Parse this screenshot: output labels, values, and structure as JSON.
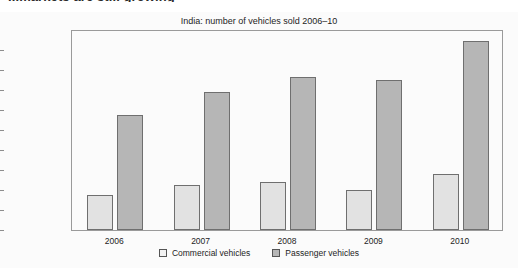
{
  "article": {
    "heading": "...markets are still growing"
  },
  "figure": {
    "title": "India: number of vehicles sold 2006–10"
  },
  "legend": {
    "position": "bottom-center",
    "items": [
      {
        "label": "Commercial vehicles",
        "swatch": "legend-swatch-commercial",
        "color": "#f2f2f2"
      },
      {
        "label": "Passenger vehicles",
        "swatch": "legend-swatch-passenger",
        "color": "#b6b6b6"
      }
    ]
  },
  "axes": {
    "y_ticks": [
      "2 000 000",
      "1 800 000",
      "1 600 000",
      "1 400 000",
      "1 200 000",
      "1 000 000",
      "800 000",
      "600 000",
      "400 000",
      "200 000",
      "0"
    ],
    "x_ticks": [
      "2006",
      "2007",
      "2008",
      "2009",
      "2010"
    ]
  },
  "chart_data": {
    "type": "bar",
    "title": "India: number of vehicles sold 2006–10",
    "xlabel": "",
    "ylabel": "",
    "ylim": [
      0,
      2000000
    ],
    "ytick_interval": 200000,
    "grid": false,
    "legend_position": "bottom-center",
    "categories": [
      "2006",
      "2007",
      "2008",
      "2009",
      "2010"
    ],
    "series": [
      {
        "name": "Commercial vehicles",
        "color": "#e2e2e2",
        "values": [
          350000,
          450000,
          480000,
          400000,
          565000
        ]
      },
      {
        "name": "Passenger vehicles",
        "color": "#b6b6b6",
        "values": [
          1150000,
          1380000,
          1530000,
          1500000,
          1890000
        ]
      }
    ]
  }
}
